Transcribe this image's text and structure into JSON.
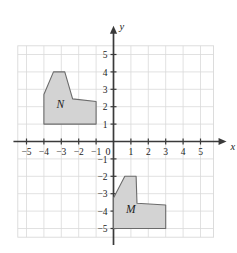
{
  "figure": {
    "title": "",
    "background_color": "#ffffff"
  },
  "chart_data": {
    "type": "scatter",
    "title": "",
    "xlabel": "x",
    "ylabel": "y",
    "xlim": [
      -6,
      6
    ],
    "ylim": [
      -6,
      6
    ],
    "grid": true,
    "legend": "none",
    "x_ticks": [
      -5,
      -4,
      -3,
      -2,
      -1,
      1,
      2,
      3,
      4,
      5
    ],
    "y_ticks": [
      5,
      4,
      3,
      2,
      1,
      -1,
      -2,
      -3,
      -4,
      -5
    ],
    "x_tick_labels": [
      "−5",
      "−4",
      "−3",
      "−2",
      "−1",
      "1",
      "2",
      "3",
      "4",
      "5"
    ],
    "y_tick_labels": [
      "5",
      "4",
      "3",
      "2",
      "1",
      "−1",
      "−2",
      "−3",
      "−4",
      "−5"
    ],
    "origin_label": "0",
    "axis_x_name": "x",
    "axis_y_name": "y",
    "shapes": [
      {
        "label": "N",
        "label_position": [
          -3.05,
          1.95
        ],
        "fill": "#d3d3d3",
        "stroke": "#6b6b6b",
        "vertices": [
          [
            -4.0,
            1.0
          ],
          [
            -4.0,
            2.7
          ],
          [
            -3.45,
            4.0
          ],
          [
            -2.8,
            4.0
          ],
          [
            -2.35,
            2.45
          ],
          [
            -1.0,
            2.3
          ],
          [
            -1.0,
            1.0
          ]
        ]
      },
      {
        "label": "M",
        "label_position": [
          1.0,
          -4.1
        ],
        "fill": "#d3d3d3",
        "stroke": "#6b6b6b",
        "vertices": [
          [
            0.0,
            -5.0
          ],
          [
            0.0,
            -3.25
          ],
          [
            0.65,
            -2.0
          ],
          [
            1.3,
            -2.0
          ],
          [
            1.35,
            -3.55
          ],
          [
            3.0,
            -3.65
          ],
          [
            3.0,
            -5.0
          ]
        ]
      }
    ]
  }
}
